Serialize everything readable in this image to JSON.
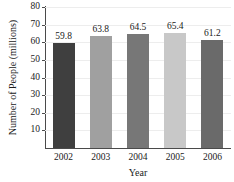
{
  "chart_data": {
    "type": "bar",
    "title": "",
    "xlabel": "Year",
    "ylabel": "Number of People (millions)",
    "categories": [
      "2002",
      "2003",
      "2004",
      "2005",
      "2006"
    ],
    "values": [
      59.8,
      63.8,
      64.5,
      65.4,
      61.2
    ],
    "value_labels": [
      "59.8",
      "63.8",
      "64.5",
      "65.4",
      "61.2"
    ],
    "ylim": [
      0,
      80
    ],
    "ytick_values": [
      10,
      20,
      30,
      40,
      50,
      60,
      70,
      80
    ],
    "ytick_labels": [
      "10",
      "20",
      "30",
      "40",
      "50",
      "60",
      "70",
      "80"
    ],
    "grid": true,
    "legend": false,
    "bar_colors": [
      "#3f3f3f",
      "#a0a0a0",
      "#777777",
      "#c8c8c8",
      "#6a6a6a"
    ],
    "axis_color": "#4a4a4a",
    "grid_color": "#ededed",
    "background": "#ffffff"
  }
}
